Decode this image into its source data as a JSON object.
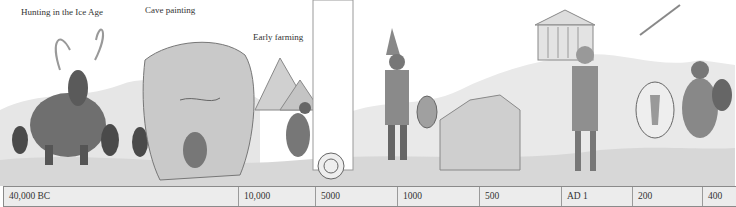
{
  "captions": [
    {
      "id": "hunting",
      "text": "Hunting in the Ice Age"
    },
    {
      "id": "cave",
      "text": "Cave painting"
    },
    {
      "id": "farming",
      "text": "Early farming"
    }
  ],
  "scenes": [
    "mammoth-hunt",
    "cave-painting",
    "pyramids-and-farmer",
    "scroll-divider",
    "assyrian-warrior",
    "great-wall",
    "greek-temple",
    "roman-soldier",
    "barbarian-warriors"
  ],
  "timeline": {
    "labels": [
      "40,000 BC",
      "10,000",
      "5000",
      "1000",
      "500",
      "AD 1",
      "200",
      "400"
    ]
  },
  "colors": {
    "timeline_bg": "#ececec",
    "border": "#8a8a8a",
    "text": "#333333"
  }
}
